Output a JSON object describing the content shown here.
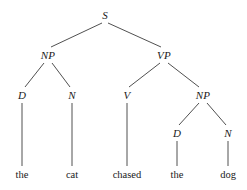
{
  "diagram": {
    "sentence": "the cat chased the dog",
    "background_color": "#ffffff",
    "line_color": "#3c3c3c",
    "text_color": "#1a1a1a"
  },
  "nodes": [
    {
      "id": "s",
      "label": "S",
      "x": 105,
      "y": 15,
      "kind": "nonterminal"
    },
    {
      "id": "np1",
      "label": "NP",
      "x": 48,
      "y": 55,
      "kind": "nonterminal"
    },
    {
      "id": "vp",
      "label": "VP",
      "x": 164,
      "y": 55,
      "kind": "nonterminal"
    },
    {
      "id": "d1",
      "label": "D",
      "x": 22,
      "y": 95,
      "kind": "nonterminal"
    },
    {
      "id": "n1",
      "label": "N",
      "x": 72,
      "y": 95,
      "kind": "nonterminal"
    },
    {
      "id": "v",
      "label": "V",
      "x": 127,
      "y": 95,
      "kind": "nonterminal"
    },
    {
      "id": "np2",
      "label": "NP",
      "x": 203,
      "y": 95,
      "kind": "nonterminal"
    },
    {
      "id": "d2",
      "label": "D",
      "x": 177,
      "y": 133,
      "kind": "nonterminal"
    },
    {
      "id": "n2",
      "label": "N",
      "x": 228,
      "y": 133,
      "kind": "nonterminal"
    }
  ],
  "terminals": [
    {
      "id": "w-the1",
      "label": "the",
      "x": 22,
      "y": 174
    },
    {
      "id": "w-cat",
      "label": "cat",
      "x": 72,
      "y": 174
    },
    {
      "id": "w-chased",
      "label": "chased",
      "x": 127,
      "y": 174
    },
    {
      "id": "w-the2",
      "label": "the",
      "x": 177,
      "y": 174
    },
    {
      "id": "w-dog",
      "label": "dog",
      "x": 228,
      "y": 174
    }
  ],
  "edges": [
    {
      "id": "s-np1",
      "from": "s",
      "to": "np1",
      "x1": 102,
      "y1": 23,
      "x2": 51,
      "y2": 47
    },
    {
      "id": "s-vp",
      "from": "s",
      "to": "vp",
      "x1": 108,
      "y1": 23,
      "x2": 161,
      "y2": 47
    },
    {
      "id": "np1-d1",
      "from": "np1",
      "to": "d1",
      "x1": 44,
      "y1": 63,
      "x2": 25,
      "y2": 87
    },
    {
      "id": "np1-n1",
      "from": "np1",
      "to": "n1",
      "x1": 52,
      "y1": 63,
      "x2": 70,
      "y2": 87
    },
    {
      "id": "vp-v",
      "from": "vp",
      "to": "v",
      "x1": 160,
      "y1": 63,
      "x2": 129,
      "y2": 87
    },
    {
      "id": "vp-np2",
      "from": "vp",
      "to": "np2",
      "x1": 168,
      "y1": 63,
      "x2": 199,
      "y2": 87
    },
    {
      "id": "np2-d2",
      "from": "np2",
      "to": "d2",
      "x1": 199,
      "y1": 103,
      "x2": 179,
      "y2": 125
    },
    {
      "id": "np2-n2",
      "from": "np2",
      "to": "n2",
      "x1": 207,
      "y1": 103,
      "x2": 226,
      "y2": 125
    },
    {
      "id": "d1-the1",
      "from": "d1",
      "to": "w-the1",
      "x1": 22,
      "y1": 103,
      "x2": 22,
      "y2": 166
    },
    {
      "id": "n1-cat",
      "from": "n1",
      "to": "w-cat",
      "x1": 72,
      "y1": 103,
      "x2": 72,
      "y2": 166
    },
    {
      "id": "v-chased",
      "from": "v",
      "to": "w-chased",
      "x1": 127,
      "y1": 103,
      "x2": 127,
      "y2": 166
    },
    {
      "id": "d2-the2",
      "from": "d2",
      "to": "w-the2",
      "x1": 177,
      "y1": 141,
      "x2": 177,
      "y2": 166
    },
    {
      "id": "n2-dog",
      "from": "n2",
      "to": "w-dog",
      "x1": 228,
      "y1": 141,
      "x2": 228,
      "y2": 166
    }
  ]
}
